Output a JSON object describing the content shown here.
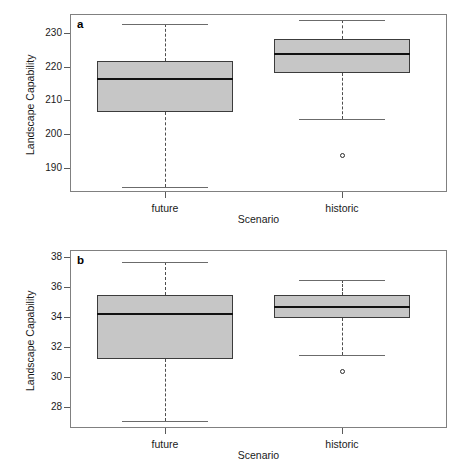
{
  "figure": {
    "panels": [
      {
        "tag": "a",
        "ylabel": "Landscape Capability",
        "xlabel": "Scenario",
        "yticks": [
          "230",
          "220",
          "210",
          "200",
          "190"
        ],
        "xticks": [
          "future",
          "historic"
        ]
      },
      {
        "tag": "b",
        "ylabel": "Landscape Capability",
        "xlabel": "Scenario",
        "yticks": [
          "38",
          "36",
          "34",
          "32",
          "30",
          "28"
        ],
        "xticks": [
          "future",
          "historic"
        ]
      }
    ]
  },
  "chart_data": [
    {
      "type": "box",
      "panel": "a",
      "title": "",
      "xlabel": "Scenario",
      "ylabel": "Landscape Capability",
      "ylim": [
        183.0,
        235.5
      ],
      "ytick_values": [
        230,
        220,
        210,
        200,
        190
      ],
      "categories": [
        "future",
        "historic"
      ],
      "grid": false,
      "legend": "none",
      "boxes": [
        {
          "name": "future",
          "whisker_low": 184.5,
          "q1": 206.5,
          "median": 216.3,
          "q3": 221.5,
          "whisker_high": 232.5,
          "outliers": []
        },
        {
          "name": "historic",
          "whisker_low": 204.5,
          "q1": 218.0,
          "median": 223.7,
          "q3": 228.0,
          "whisker_high": 233.8,
          "outliers": [
            193.8
          ]
        }
      ]
    },
    {
      "type": "box",
      "panel": "b",
      "title": "",
      "xlabel": "Scenario",
      "ylabel": "Landscape Capability",
      "ylim": [
        26.6,
        38.5
      ],
      "ytick_values": [
        38,
        36,
        34,
        32,
        30,
        28
      ],
      "categories": [
        "future",
        "historic"
      ],
      "grid": false,
      "legend": "none",
      "boxes": [
        {
          "name": "future",
          "whisker_low": 27.1,
          "q1": 31.2,
          "median": 34.25,
          "q3": 35.5,
          "whisker_high": 37.7,
          "outliers": []
        },
        {
          "name": "historic",
          "whisker_low": 31.45,
          "q1": 33.95,
          "median": 34.7,
          "q3": 35.5,
          "whisker_high": 36.5,
          "outliers": [
            30.35
          ]
        }
      ]
    }
  ],
  "style": {
    "box_fill": "#c6c6c6",
    "box_border": "#3c3c3c",
    "median_color": "#111111",
    "whisker_color": "#6b6b6b",
    "frame_color": "#808080"
  }
}
